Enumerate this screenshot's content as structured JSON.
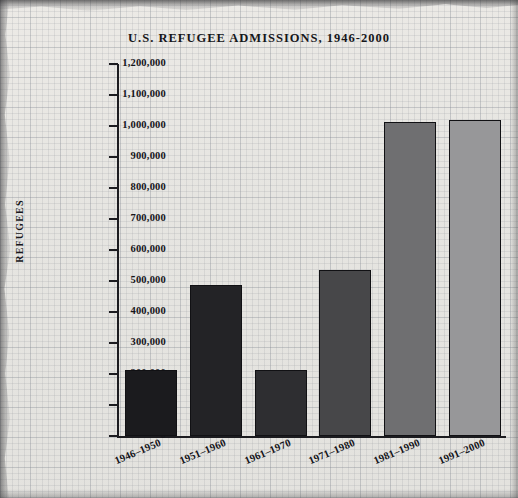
{
  "chart_data": {
    "type": "bar",
    "title": "U.S. REFUGEE ADMISSIONS, 1946-2000",
    "xlabel": "",
    "ylabel": "REFUGEES",
    "categories": [
      "1946–1950",
      "1951–1960",
      "1961–1970",
      "1971–1980",
      "1981–1990",
      "1991–2000"
    ],
    "values": [
      213000,
      487000,
      212000,
      534000,
      1013000,
      1021000
    ],
    "ylim": [
      0,
      1200000
    ],
    "ytick_values": [
      0,
      100000,
      200000,
      300000,
      400000,
      500000,
      600000,
      700000,
      800000,
      900000,
      1000000,
      1100000,
      1200000
    ],
    "ytick_labels": [
      "0",
      "100,000",
      "200,000",
      "300,000",
      "400,000",
      "500,000",
      "600,000",
      "700,000",
      "800,000",
      "900,000",
      "1,000,000",
      "1,100,000",
      "1,200,000"
    ],
    "bar_colors": [
      "#1b1b1e",
      "#232326",
      "#2e2e31",
      "#474749",
      "#6f6f71",
      "#979799"
    ],
    "bar_edge_color": "#111114",
    "grid": true,
    "legend": null,
    "background_color": "#e7e6e2",
    "axis_color": "#1c1c20"
  }
}
